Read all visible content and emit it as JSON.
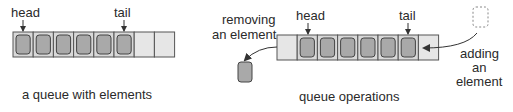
{
  "colors": {
    "cell_border": "#555555",
    "cell_empty": "#e6e6e6",
    "element_fill": "#a9a9a9",
    "element_border": "#444444",
    "arrow": "#333333",
    "dashed": "#888888"
  },
  "left_diagram": {
    "head_label": "head",
    "tail_label": "tail",
    "total_cells": 8,
    "filled_cells": 6,
    "caption": "a queue with elements"
  },
  "right_diagram": {
    "head_label": "head",
    "tail_label": "tail",
    "total_cells": 8,
    "filled_cells": [
      1,
      2,
      3,
      4,
      5,
      6
    ],
    "removing_label_line1": "removing",
    "removing_label_line2": "an element",
    "adding_label_line1": "adding",
    "adding_label_line2": "an",
    "adding_label_line3": "element",
    "caption": "queue operations"
  }
}
